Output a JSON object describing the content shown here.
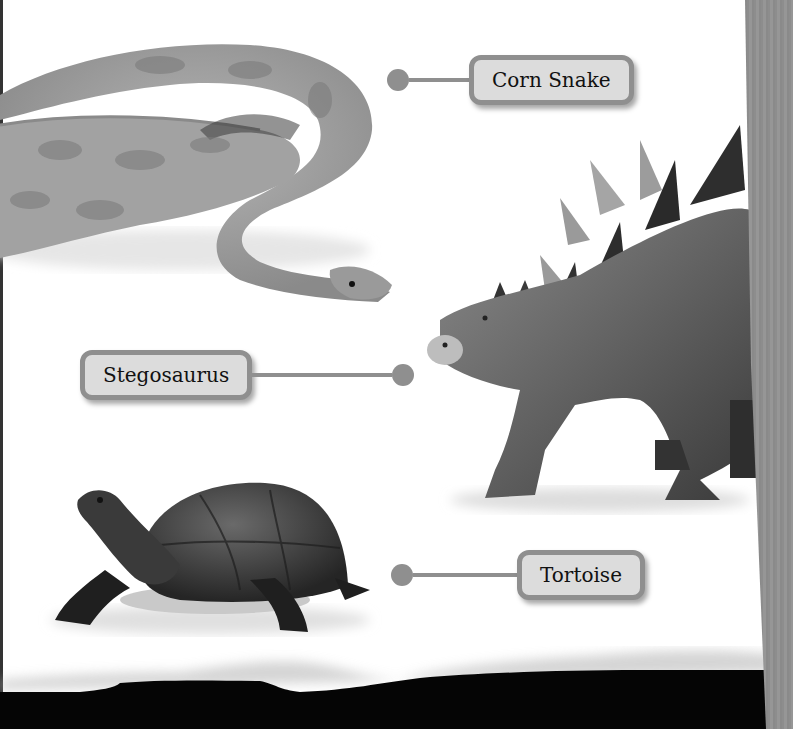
{
  "callouts": [
    {
      "label": "Corn Snake",
      "animal": "corn snake"
    },
    {
      "label": "Stegosaurus",
      "animal": "stegosaurus"
    },
    {
      "label": "Tortoise",
      "animal": "tortoise"
    }
  ],
  "colors": {
    "label_fill": "#dcdcdc",
    "label_border": "#8f8f8f",
    "connector": "#8f8f8f",
    "background": "#ffffff",
    "bottom_band": "#050505"
  }
}
